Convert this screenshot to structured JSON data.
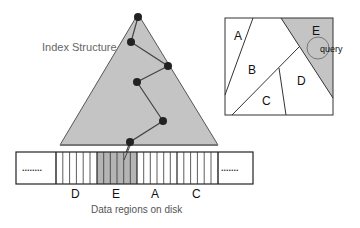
{
  "index_structure": {
    "label": "Index Structure",
    "fill": "#c4c4c4",
    "stroke": "#555555",
    "triangle": [
      [
        138,
        14
      ],
      [
        60,
        145
      ],
      [
        218,
        145
      ]
    ],
    "nodes": [
      [
        138,
        17
      ],
      [
        131,
        42
      ],
      [
        168,
        66
      ],
      [
        137,
        82
      ],
      [
        163,
        121
      ],
      [
        130,
        142
      ]
    ],
    "node_color": "#222222"
  },
  "disk": {
    "caption": "Data regions on disk",
    "left_ellipsis": "........",
    "right_ellipsis": ".......",
    "groups": [
      {
        "label": "D",
        "shaded": false
      },
      {
        "label": "E",
        "shaded": true
      },
      {
        "label": "A",
        "shaded": false
      },
      {
        "label": "C",
        "shaded": false
      }
    ],
    "shade_color": "#b4b4b4"
  },
  "space_partition": {
    "regions": [
      "A",
      "B",
      "C",
      "D",
      "E"
    ],
    "query_label": "query",
    "highlight_region": "E",
    "highlight_color": "#c4c4c4"
  }
}
